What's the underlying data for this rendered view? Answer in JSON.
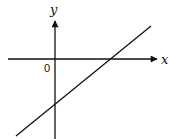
{
  "diagram": {
    "type": "coordinate-axes-with-line",
    "x_axis_label": "x",
    "y_axis_label": "y",
    "origin_label": "0",
    "line": {
      "description": "straight line with positive slope, negative y-intercept, positive x-intercept",
      "slope_sign": "positive",
      "y_intercept_sign": "negative",
      "x_intercept_sign": "positive"
    },
    "colors": {
      "stroke": "#111111",
      "background": "#ffffff"
    }
  }
}
